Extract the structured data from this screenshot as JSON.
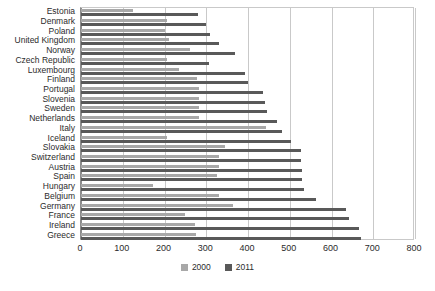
{
  "chart_data": {
    "type": "bar",
    "orientation": "horizontal",
    "title": "",
    "xlabel": "",
    "ylabel": "",
    "xlim": [
      0,
      800
    ],
    "xticks": [
      0,
      100,
      200,
      300,
      400,
      500,
      600,
      700,
      800
    ],
    "grid": true,
    "legend_position": "bottom",
    "colors": {
      "2000": "#a8a8a8",
      "2011": "#595959",
      "gridline": "#c9c9c9",
      "axis": "#8c8c8c",
      "text": "#2b2b2b",
      "background": "#ffffff"
    },
    "categories": [
      "Estonia",
      "Denmark",
      "Poland",
      "United Kingdom",
      "Norway",
      "Czech Republic",
      "Luxembourg",
      "Finland",
      "Portugal",
      "Slovenia",
      "Sweden",
      "Netherlands",
      "Italy",
      "Iceland",
      "Slovakia",
      "Switzerland",
      "Austria",
      "Spain",
      "Hungary",
      "Belgium",
      "Germany",
      "France",
      "Ireland",
      "Greece"
    ],
    "series": [
      {
        "name": "2000",
        "color": "#a8a8a8",
        "values": [
          125,
          205,
          200,
          210,
          260,
          207,
          235,
          278,
          283,
          283,
          283,
          283,
          443,
          205,
          345,
          330,
          330,
          326,
          172,
          330,
          364,
          249,
          273,
          276
        ]
      },
      {
        "name": "2011",
        "color": "#595959",
        "values": [
          280,
          300,
          310,
          330,
          370,
          307,
          393,
          400,
          435,
          440,
          445,
          470,
          482,
          503,
          527,
          527,
          530,
          530,
          534,
          563,
          635,
          642,
          666,
          671
        ]
      }
    ],
    "legend": [
      {
        "label": "2000",
        "key": "2000"
      },
      {
        "label": "2011",
        "key": "2011"
      }
    ]
  }
}
